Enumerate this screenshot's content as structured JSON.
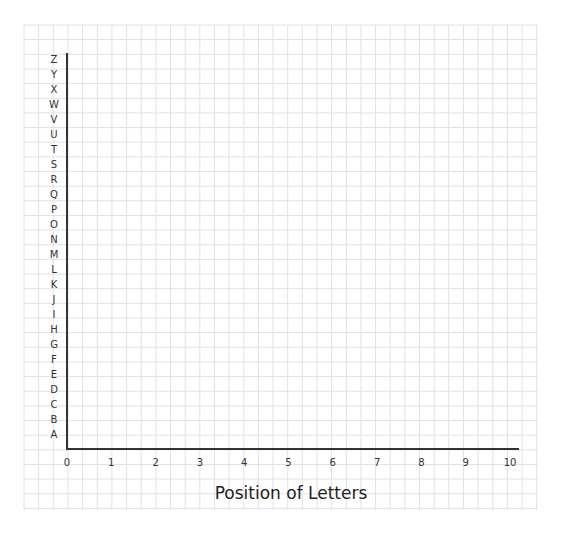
{
  "chart_data": {
    "type": "scatter",
    "title": "",
    "xlabel": "Position of Letters",
    "ylabel": "",
    "x_ticks": [
      "0",
      "1",
      "2",
      "3",
      "4",
      "5",
      "6",
      "7",
      "8",
      "9",
      "10"
    ],
    "y_ticks": [
      "A",
      "B",
      "C",
      "D",
      "E",
      "F",
      "G",
      "H",
      "I",
      "J",
      "K",
      "L",
      "M",
      "N",
      "O",
      "P",
      "Q",
      "R",
      "S",
      "T",
      "U",
      "V",
      "W",
      "X",
      "Y",
      "Z"
    ],
    "xlim": [
      0,
      10
    ],
    "ylim": [
      "A",
      "Z"
    ],
    "grid": true,
    "series": [],
    "legend": null
  },
  "style": {
    "axis_color": "#333333",
    "grid_color": "#e2e2e2",
    "background": "#ffffff"
  },
  "labels": {
    "x_axis_title": "Position of Letters"
  }
}
